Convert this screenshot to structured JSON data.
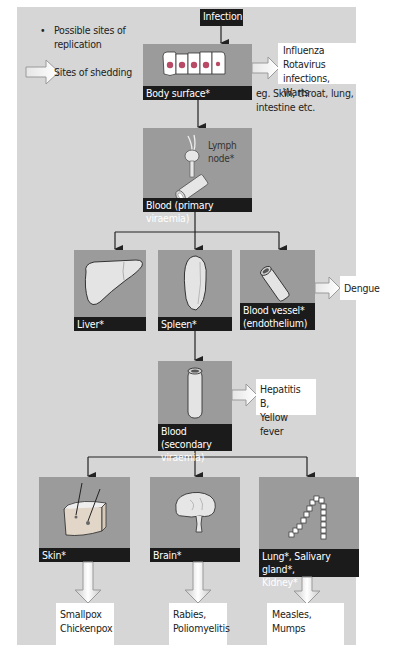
{
  "legend": {
    "replication_bullet": "•",
    "replication_label": "Possible sites of replication",
    "replication_line1": "Possible sites of",
    "replication_line2": "replication",
    "shedding_label": "Sites of shedding"
  },
  "start": {
    "label": "Infection"
  },
  "body_surface": {
    "label": "Body surface*",
    "shedding": [
      "Influenza",
      "Rotavirus infections,",
      "Warts"
    ],
    "examples_line1": "eg. Skin, throat, lung,",
    "examples_line2": "intestine etc."
  },
  "primary": {
    "label": "Blood (primary viraemia)",
    "annotation_line1": "Lymph",
    "annotation_line2": "node*"
  },
  "tier2": [
    {
      "label": "Liver*",
      "icon": "liver-icon"
    },
    {
      "label": "Spleen*",
      "icon": "spleen-icon"
    },
    {
      "label_line1": "Blood vessel*",
      "label_line2": "(endothelium)",
      "icon": "blood-vessel-icon",
      "shedding": "Dengue"
    }
  ],
  "secondary": {
    "label_line1": "Blood (secondary",
    "label_line2": "viraemia)",
    "shedding_line1": "Hepatitis B,",
    "shedding_line2": "Yellow fever"
  },
  "tier3": [
    {
      "label": "Skin*",
      "icon": "skin-icon",
      "shedding_line1": "Smallpox",
      "shedding_line2": "Chickenpox"
    },
    {
      "label": "Brain*",
      "icon": "brain-icon",
      "shedding_line1": "Rabies,",
      "shedding_line2": "Poliomyelitis"
    },
    {
      "label_line1": "Lung*, Salivary gland*,",
      "label_line2": "Kidney*",
      "icon": "lung-icon",
      "shedding_line1": "Measles, Mumps"
    }
  ],
  "colors": {
    "panel": "#d6d6d6",
    "tile": "#9b9b9b",
    "label_bar": "#1b1b1b",
    "cell_nucleus": "#c0506a"
  }
}
